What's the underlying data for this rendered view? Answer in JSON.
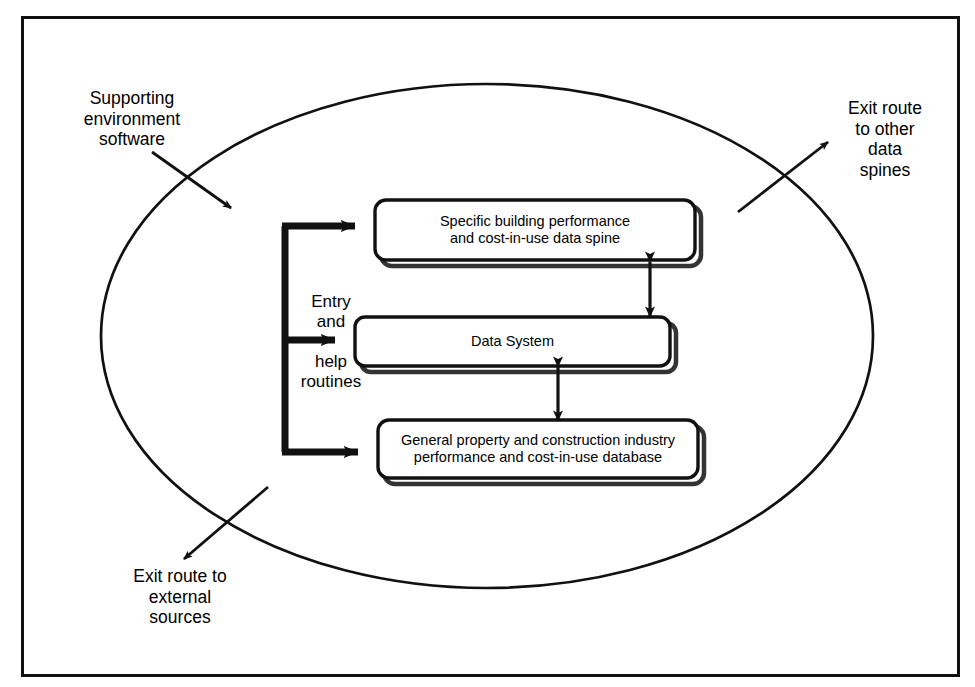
{
  "diagram": {
    "frame": {
      "name": "outer-border",
      "x": 21,
      "y": 16,
      "width": 939,
      "height": 661,
      "stroke": "#000000",
      "stroke_width": 3
    },
    "boundary": {
      "name": "supporting-environment-boundary",
      "shape": "ellipse",
      "cx": 487,
      "cy": 336,
      "rx": 386,
      "ry": 252,
      "stroke": "#000000",
      "stroke_width": 2.6
    },
    "colors": {
      "ink": "#000000",
      "paper": "#ffffff",
      "shadow": "#000000"
    },
    "annotations": [
      {
        "id": "supporting-environment-software",
        "text": "Supporting\nenvironment\nsoftware",
        "x": 52,
        "y": 88,
        "width": 160,
        "arrow": {
          "x1": 152,
          "y1": 152,
          "x2": 231,
          "y2": 208
        }
      },
      {
        "id": "exit-route-other-data-spines",
        "text": "Exit route\nto other\ndata\nspines",
        "x": 820,
        "y": 98,
        "width": 130,
        "arrow": {
          "x1": 738,
          "y1": 212,
          "x2": 828,
          "y2": 142
        }
      },
      {
        "id": "exit-route-external-sources",
        "text": "Exit route to\nexternal\nsources",
        "x": 90,
        "y": 566,
        "width": 180,
        "arrow": {
          "x1": 268,
          "y1": 487,
          "x2": 184,
          "y2": 559
        }
      }
    ],
    "boxes": [
      {
        "id": "specific-building-data-spine",
        "text": "Specific building performance\nand cost-in-use data spine",
        "x": 375,
        "y": 200,
        "width": 320,
        "height": 60
      },
      {
        "id": "data-system",
        "text": "Data System",
        "x": 355,
        "y": 317,
        "width": 315,
        "height": 49
      },
      {
        "id": "general-property-database",
        "text": "General property and construction industry\nperformance and cost-in-use database",
        "x": 378,
        "y": 420,
        "width": 320,
        "height": 58
      }
    ],
    "trunk": {
      "id": "entry-and-help-routines-trunk",
      "x": 285,
      "y_top": 226,
      "y_bottom": 452,
      "stroke_width": 7,
      "branches": [
        {
          "id": "branch-to-data-spine",
          "y": 226,
          "x_end": 372
        },
        {
          "id": "branch-to-data-system",
          "y": 340,
          "x_end": 352
        },
        {
          "id": "branch-to-database",
          "y": 452,
          "x_end": 375
        }
      ]
    },
    "branch_labels": [
      {
        "id": "entry-and-label",
        "text": "Entry\nand",
        "x": 292,
        "y": 292,
        "width": 78
      },
      {
        "id": "help-routines-label",
        "text": "help\nroutines",
        "x": 278,
        "y": 352,
        "width": 106
      }
    ],
    "connectors": [
      {
        "id": "spine-to-data-system-connector",
        "type": "double-headed-arrow",
        "x": 650,
        "y1": 258,
        "y2": 320
      },
      {
        "id": "data-system-to-database-connector",
        "type": "double-headed-arrow",
        "x": 558,
        "y1": 363,
        "y2": 424
      }
    ]
  }
}
